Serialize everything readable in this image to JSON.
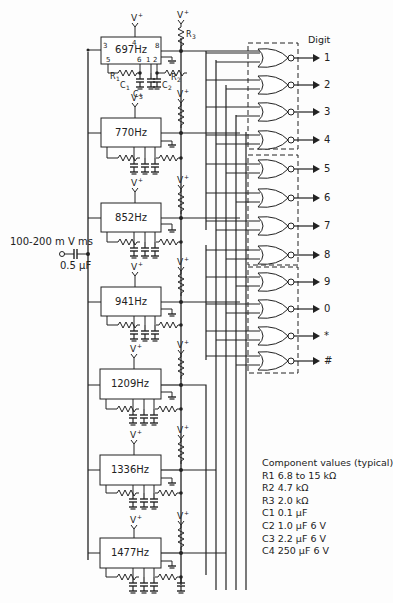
{
  "diagram": {
    "type": "schematic",
    "digit_header": "Digit",
    "input": {
      "signal_label": "100-200 m V ms",
      "coupling_capacitor": "0.5 µF"
    },
    "oscillators": [
      {
        "label": "697Hz",
        "pins": {
          "p3": "3",
          "p4": "4",
          "p5": "5",
          "p6": "6",
          "p1": "1",
          "p2": "2",
          "p8": "8"
        }
      },
      {
        "label": "770Hz"
      },
      {
        "label": "852Hz"
      },
      {
        "label": "941Hz"
      },
      {
        "label": "1209Hz"
      },
      {
        "label": "1336Hz"
      },
      {
        "label": "1477Hz"
      }
    ],
    "first_stage_labels": {
      "supply": "V+",
      "r1": "R1",
      "r2": "R2",
      "r3": "R3",
      "c1": "C1",
      "c2": "C2",
      "c3": "C3"
    },
    "gate_groups": [
      {
        "digits": [
          "1",
          "2",
          "3",
          "4"
        ]
      },
      {
        "digits": [
          "5",
          "6",
          "7",
          "8"
        ]
      },
      {
        "digits": [
          "9",
          "0",
          "*",
          "#"
        ]
      }
    ],
    "digits": [
      "1",
      "2",
      "3",
      "4",
      "5",
      "6",
      "7",
      "8",
      "9",
      "0",
      "*",
      "#"
    ],
    "component_values": {
      "title": "Component values (typical)",
      "items": [
        {
          "name": "R1",
          "value": "6.8 to 15 kΩ"
        },
        {
          "name": "R2",
          "value": "4.7 kΩ"
        },
        {
          "name": "R3",
          "value": "2.0 kΩ"
        },
        {
          "name": "C1",
          "value": "0.1 µF"
        },
        {
          "name": "C2",
          "value": "1.0 µF 6 V"
        },
        {
          "name": "C3",
          "value": "2.2 µF 6 V"
        },
        {
          "name": "C4",
          "value": "250 µF 6 V"
        }
      ]
    },
    "colors": {
      "ink": "#222222",
      "background": "#fdfdfd"
    }
  }
}
